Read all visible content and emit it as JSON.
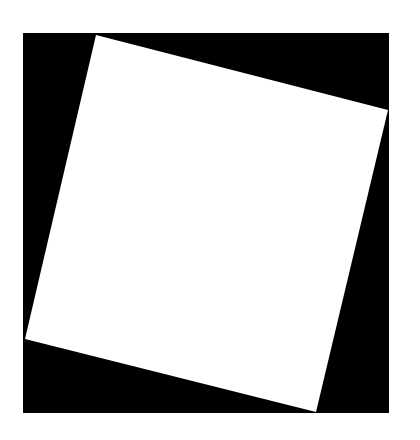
{
  "image": {
    "description": "White square rotated inside a black square on a white background",
    "background_color": "#ffffff",
    "outer_square": {
      "color": "#000000",
      "x": 23,
      "y": 33,
      "width": 366,
      "height": 380
    },
    "inner_square": {
      "color": "#ffffff",
      "points": [
        [
          96,
          35
        ],
        [
          388,
          110
        ],
        [
          316,
          412
        ],
        [
          25,
          339
        ]
      ]
    }
  }
}
